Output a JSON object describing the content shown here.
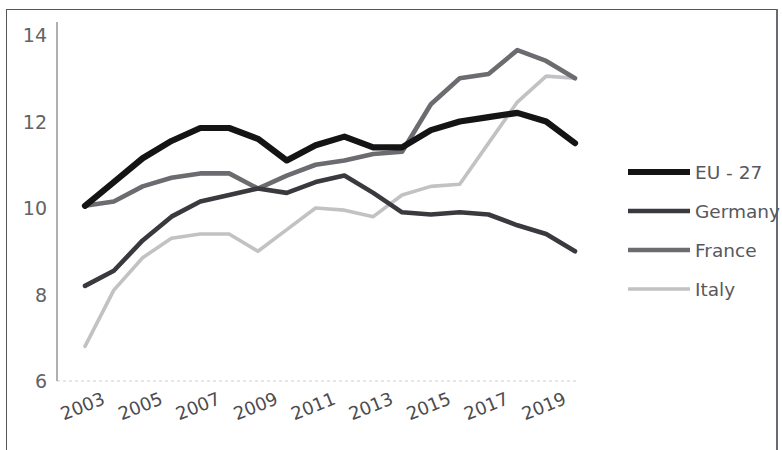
{
  "chart_data": {
    "type": "line",
    "title": "",
    "subtitle": "",
    "xlabel": "",
    "ylabel": "",
    "x": [
      2003,
      2004,
      2005,
      2006,
      2007,
      2008,
      2009,
      2010,
      2011,
      2012,
      2013,
      2014,
      2015,
      2016,
      2017,
      2018,
      2019,
      2020
    ],
    "xtick_labels": [
      "2003",
      "2005",
      "2007",
      "2009",
      "2011",
      "2013",
      "2015",
      "2017",
      "2019"
    ],
    "xtick_values": [
      2003,
      2005,
      2007,
      2009,
      2011,
      2013,
      2015,
      2017,
      2019
    ],
    "ytick_labels": [
      "6",
      "8",
      "10",
      "12",
      "14"
    ],
    "ytick_values": [
      6,
      8,
      10,
      12,
      14
    ],
    "ylim": [
      6,
      14
    ],
    "xlim": [
      2003,
      2020
    ],
    "grid": "horizontal-baseline-only",
    "legend_position": "right",
    "series": [
      {
        "name": "EU - 27",
        "color": "#141414",
        "width": 6.2,
        "values": [
          10.05,
          10.6,
          11.15,
          11.55,
          11.85,
          11.85,
          11.6,
          11.1,
          11.45,
          11.65,
          11.4,
          11.4,
          11.8,
          12.0,
          12.1,
          12.2,
          12.0,
          11.5
        ]
      },
      {
        "name": "Germany",
        "color": "#3a3a3e",
        "width": 4.6,
        "values": [
          8.2,
          8.55,
          9.25,
          9.8,
          10.15,
          10.3,
          10.45,
          10.35,
          10.6,
          10.75,
          10.35,
          9.9,
          9.85,
          9.9,
          9.85,
          9.6,
          9.4,
          9.0
        ]
      },
      {
        "name": "France",
        "color": "#6b6b70",
        "width": 4.6,
        "values": [
          10.05,
          10.15,
          10.5,
          10.7,
          10.8,
          10.8,
          10.45,
          10.75,
          11.0,
          11.1,
          11.25,
          11.3,
          12.4,
          13.0,
          13.1,
          13.65,
          13.4,
          13.0
        ]
      },
      {
        "name": "Italy",
        "color": "#c2c2c5",
        "width": 3.6,
        "values": [
          6.8,
          8.1,
          8.85,
          9.3,
          9.4,
          9.4,
          9.0,
          9.5,
          10.0,
          9.95,
          9.8,
          10.3,
          10.5,
          10.55,
          11.5,
          12.45,
          13.05,
          13.0
        ]
      }
    ]
  },
  "legend": {
    "items": [
      {
        "label": "EU - 27"
      },
      {
        "label": "Germany"
      },
      {
        "label": "France"
      },
      {
        "label": "Italy"
      }
    ]
  }
}
